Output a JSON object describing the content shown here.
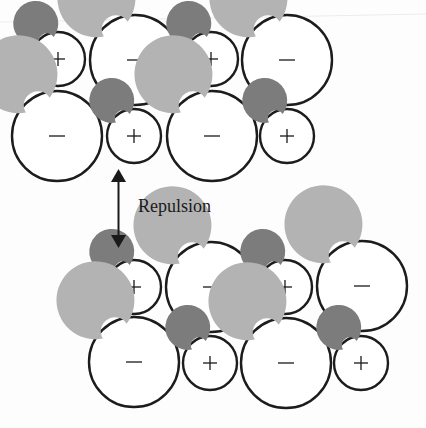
{
  "diagram": {
    "title": "",
    "colors": {
      "background": "#fdfdfd",
      "ring_stroke": "#1c1c1c",
      "cation_fill": "#7c7c7c",
      "anion_fill": "#b3b3b3",
      "gap_fill": "#ffffff"
    },
    "legend": {
      "cation_sign": "+",
      "anion_sign": "−"
    },
    "label": {
      "text": "Repulsion",
      "x": 138,
      "y": 212
    },
    "arrow": {
      "x": 118.5,
      "y_top": 169,
      "y_bottom": 248,
      "direction": "double-headed vertical"
    },
    "groups": [
      {
        "name": "upper-crystal-layer",
        "ions": [
          {
            "type": "cation",
            "sign": "+",
            "cx": 58,
            "cy": 59,
            "r": 27
          },
          {
            "type": "anion",
            "sign": "−",
            "cx": 135,
            "cy": 60,
            "r": 45
          },
          {
            "type": "cation",
            "sign": "+",
            "cx": 211,
            "cy": 59,
            "r": 27
          },
          {
            "type": "anion",
            "sign": "−",
            "cx": 287,
            "cy": 60,
            "r": 45
          },
          {
            "type": "anion",
            "sign": "−",
            "cx": 57,
            "cy": 136,
            "r": 45
          },
          {
            "type": "cation",
            "sign": "+",
            "cx": 134,
            "cy": 136,
            "r": 27
          },
          {
            "type": "anion",
            "sign": "−",
            "cx": 212,
            "cy": 136,
            "r": 45
          },
          {
            "type": "cation",
            "sign": "+",
            "cx": 287,
            "cy": 136,
            "r": 27
          }
        ]
      },
      {
        "name": "lower-crystal-layer",
        "ions": [
          {
            "type": "cation",
            "sign": "+",
            "cx": 134,
            "cy": 287,
            "r": 27
          },
          {
            "type": "anion",
            "sign": "−",
            "cx": 211,
            "cy": 287,
            "r": 45
          },
          {
            "type": "cation",
            "sign": "+",
            "cx": 285,
            "cy": 287,
            "r": 27
          },
          {
            "type": "anion",
            "sign": "−",
            "cx": 362,
            "cy": 286,
            "r": 45
          },
          {
            "type": "anion",
            "sign": "−",
            "cx": 134,
            "cy": 362,
            "r": 45
          },
          {
            "type": "cation",
            "sign": "+",
            "cx": 210,
            "cy": 363,
            "r": 27
          },
          {
            "type": "anion",
            "sign": "−",
            "cx": 286,
            "cy": 363,
            "r": 45
          },
          {
            "type": "cation",
            "sign": "+",
            "cx": 361,
            "cy": 363,
            "r": 27
          }
        ]
      }
    ]
  }
}
